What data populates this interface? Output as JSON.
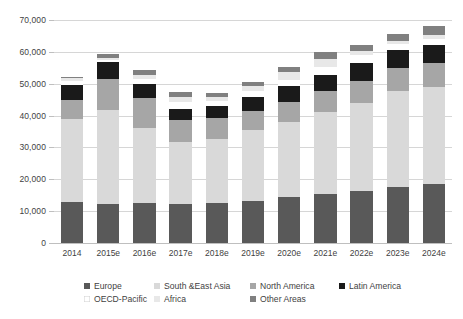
{
  "chart_data": {
    "type": "bar",
    "stacked": true,
    "title": "",
    "subtitle": "",
    "xlabel": "",
    "ylabel": "",
    "ylim": [
      0,
      70000
    ],
    "ytick_step": 10000,
    "ytick_labels": [
      "0",
      "10,000",
      "20,000",
      "30,000",
      "40,000",
      "50,000",
      "60,000",
      "70,000"
    ],
    "ytick_values": [
      0,
      10000,
      20000,
      30000,
      40000,
      50000,
      60000,
      70000
    ],
    "grid": true,
    "legend_position": "bottom",
    "categories": [
      "2014",
      "2015e",
      "2016e",
      "2017e",
      "2018e",
      "2019e",
      "2020e",
      "2021e",
      "2022e",
      "2023e",
      "2024e"
    ],
    "series": [
      {
        "name": "Europe",
        "color": "#595959",
        "values": [
          12800,
          12100,
          12700,
          12400,
          12500,
          13100,
          14300,
          15400,
          16400,
          17700,
          18500
        ]
      },
      {
        "name": "South &East Asia",
        "color": "#D9D9D9",
        "values": [
          26000,
          29700,
          23400,
          19400,
          20300,
          22400,
          23800,
          25600,
          27700,
          30100,
          30400
        ]
      },
      {
        "name": "North America",
        "color": "#A6A6A6",
        "values": [
          6200,
          9800,
          9400,
          6800,
          6500,
          5900,
          6100,
          6600,
          6900,
          7200,
          7600
        ]
      },
      {
        "name": "Latin America",
        "color": "#1A1A1A",
        "values": [
          4500,
          5300,
          4400,
          3500,
          3700,
          4300,
          5100,
          5300,
          5400,
          5600,
          5700
        ]
      },
      {
        "name": "OECD-Pacific",
        "color": "#FFFFFF",
        "values": [
          1300,
          700,
          1500,
          2300,
          1700,
          1900,
          2000,
          2300,
          2600,
          1800,
          1900
        ]
      },
      {
        "name": "Africa",
        "color": "#E8E8E8",
        "values": [
          1000,
          500,
          1300,
          1600,
          1100,
          1800,
          2300,
          2500,
          1200,
          1100,
          1200
        ]
      },
      {
        "name": "Other Areas",
        "color": "#808080",
        "values": [
          300,
          1100,
          1600,
          1400,
          1300,
          1200,
          1700,
          2200,
          1900,
          2000,
          2800
        ]
      }
    ],
    "totals": [
      52100,
      59200,
      54300,
      47400,
      47100,
      50600,
      55300,
      59900,
      62100,
      65500,
      68100
    ],
    "legend_entries": [
      {
        "label": "Europe",
        "color": "#595959"
      },
      {
        "label": "South &East Asia",
        "color": "#D9D9D9"
      },
      {
        "label": "North America",
        "color": "#A6A6A6"
      },
      {
        "label": "Latin America",
        "color": "#1A1A1A"
      },
      {
        "label": "OECD-Pacific",
        "color": "#FFFFFF"
      },
      {
        "label": "Africa",
        "color": "#E8E8E8"
      },
      {
        "label": "Other Areas",
        "color": "#808080"
      }
    ]
  }
}
